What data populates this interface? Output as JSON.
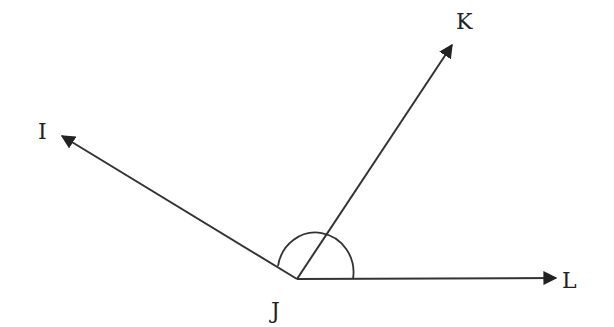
{
  "diagram": {
    "title": "",
    "stroke_color": "#333333",
    "vertex": {
      "name": "J",
      "x": 297,
      "y": 279
    },
    "rays": [
      {
        "name": "ray-JI",
        "to_label": "I",
        "x2": 60,
        "y2": 135
      },
      {
        "name": "ray-JK",
        "to_label": "K",
        "x2": 453,
        "y2": 43
      },
      {
        "name": "ray-JL",
        "to_label": "L",
        "x2": 558,
        "y2": 278
      }
    ],
    "angle_arc": {
      "marks": "angle IJL",
      "cx": 316,
      "cy": 279,
      "r": 38
    },
    "labels": {
      "I": "I",
      "J": "J",
      "K": "K",
      "L": "L"
    }
  }
}
